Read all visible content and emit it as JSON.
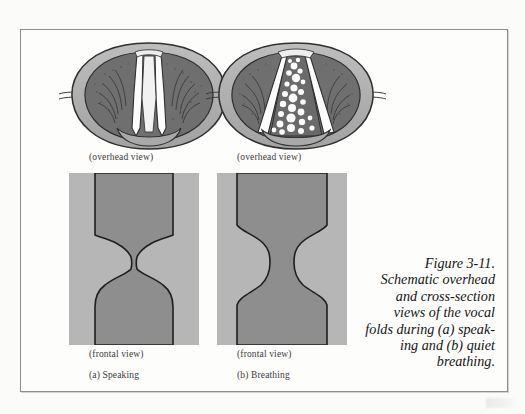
{
  "figure": {
    "id": "Figure 3-11",
    "caption_lines": [
      "Figure 3-11.",
      "Schematic overhead",
      "and cross-section",
      "views of the vocal",
      "folds during (a) speak-",
      "ing and (b) quiet",
      "breathing."
    ],
    "caption_full": "Figure 3-11. Schematic overhead and cross-section views of the vocal folds during (a) speaking and (b) quiet breathing."
  },
  "panels": {
    "overhead_a": {
      "view_label": "(overhead view)",
      "condition": "speaking",
      "glottis_state": "narrow closed slit"
    },
    "overhead_b": {
      "view_label": "(overhead view)",
      "condition": "breathing",
      "glottis_state": "wide triangular opening"
    },
    "frontal_a": {
      "view_label": "(frontal view)",
      "part_label": "(a) Speaking",
      "airway_state": "narrow constriction"
    },
    "frontal_b": {
      "view_label": "(frontal view)",
      "part_label": "(b) Breathing",
      "airway_state": "open channel"
    }
  },
  "colors": {
    "page_background": "#fbfbfa",
    "frame_border": "#8d8d8d",
    "tissue_light_gray": "#b6b6b6",
    "tissue_mid_gray": "#9a9a9a",
    "tissue_dark_gray": "#787878",
    "airway_gray": "#8e8e8e",
    "fold_white": "#fdfdfd",
    "outline": "#2e2e2e",
    "text": "#2a2a2a"
  }
}
